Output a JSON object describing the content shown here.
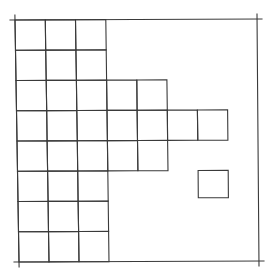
{
  "diagram": {
    "type": "grid-figure",
    "grid_divisions": 8,
    "stroke_color": "#3a3a3a",
    "background": "#ffffff",
    "outer_square_corners": {
      "top_left": [
        15,
        20
      ],
      "top_right": [
        257,
        19
      ],
      "bottom_right": [
        259,
        261
      ],
      "bottom_left": [
        19,
        262
      ]
    },
    "corner_overshoot": 5,
    "rows": [
      {
        "row": 0,
        "cols": [
          0,
          1,
          2
        ]
      },
      {
        "row": 1,
        "cols": [
          0,
          1,
          2
        ]
      },
      {
        "row": 2,
        "cols": [
          0,
          1,
          2,
          3,
          4
        ]
      },
      {
        "row": 3,
        "cols": [
          0,
          1,
          2,
          3,
          4,
          5,
          6
        ]
      },
      {
        "row": 4,
        "cols": [
          0,
          1,
          2,
          3,
          4
        ]
      },
      {
        "row": 5,
        "cols": [
          0,
          1,
          2
        ]
      },
      {
        "row": 6,
        "cols": [
          0,
          1,
          2
        ]
      },
      {
        "row": 7,
        "cols": [
          0,
          1,
          2
        ]
      }
    ],
    "isolated_cells": [
      {
        "row": 5,
        "col": 6,
        "inset_bottom": 0.1
      }
    ],
    "cell_count": 33
  }
}
